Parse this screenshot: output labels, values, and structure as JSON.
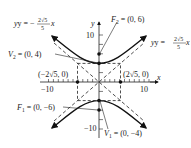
{
  "diagram": {
    "type": "hyperbola",
    "equation_form": "y^2/16 - x^2/20 = 1",
    "axes": {
      "x_label": "x",
      "y_label": "y",
      "x_ticks": {
        "neg": "−10",
        "pos": "10"
      },
      "y_ticks": {
        "pos": "10",
        "neg": "−10"
      }
    },
    "labels": {
      "asymptote_neg": {
        "lhs": "y = −",
        "num": "2√5",
        "den": "5",
        "var": "x"
      },
      "asymptote_pos": {
        "lhs": "y = ",
        "num": "2√5",
        "den": "5",
        "var": "x"
      },
      "focus2": {
        "name": "F",
        "sub": "2",
        "value": " = (0, 6)"
      },
      "focus1": {
        "name": "F",
        "sub": "1",
        "value": " = (0, −6)"
      },
      "vertex2": {
        "name": "V",
        "sub": "2",
        "value": " = (0, 4)"
      },
      "vertex1": {
        "name": "V",
        "sub": "1",
        "value": " = (0, −4)"
      },
      "covertex_left": "(−2√5, 0)",
      "covertex_right": "(2√5, 0)"
    },
    "points": [
      {
        "name": "F2",
        "x": 0,
        "y": 6
      },
      {
        "name": "V2",
        "x": 0,
        "y": 4
      },
      {
        "name": "V1",
        "x": 0,
        "y": -4
      },
      {
        "name": "F1",
        "x": 0,
        "y": -6
      },
      {
        "name": "co-vertex-left",
        "x": -4.47,
        "y": 0
      },
      {
        "name": "co-vertex-right",
        "x": 4.47,
        "y": 0
      }
    ]
  }
}
